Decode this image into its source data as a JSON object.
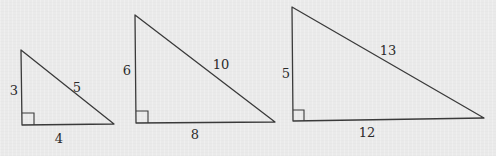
{
  "diagram": {
    "title": "",
    "stroke_color": "#3a3a3a",
    "background_color": "#eaeaea",
    "triangles": [
      {
        "id": "triangle-3-4-5",
        "vertices": {
          "top": [
            21,
            50
          ],
          "right_angle": [
            22,
            125
          ],
          "right": [
            114,
            124
          ]
        },
        "right_angle_box": 12,
        "labels": {
          "vertical": {
            "text": "3",
            "pos": [
              14,
              90
            ]
          },
          "hypotenuse": {
            "text": "5",
            "pos": [
              77,
              87
            ]
          },
          "base": {
            "text": "4",
            "pos": [
              59,
              138
            ]
          }
        }
      },
      {
        "id": "triangle-6-8-10",
        "vertices": {
          "top": [
            135,
            15
          ],
          "right_angle": [
            136,
            123
          ],
          "right": [
            275,
            122
          ]
        },
        "right_angle_box": 12,
        "labels": {
          "vertical": {
            "text": "6",
            "pos": [
              127,
              70
            ]
          },
          "hypotenuse": {
            "text": "10",
            "pos": [
              221,
              64
            ]
          },
          "base": {
            "text": "8",
            "pos": [
              195,
              134
            ]
          }
        }
      },
      {
        "id": "triangle-5-12-13",
        "vertices": {
          "top": [
            292,
            7
          ],
          "right_angle": [
            293,
            121
          ],
          "right": [
            484,
            118
          ]
        },
        "right_angle_box": 11,
        "labels": {
          "vertical": {
            "text": "5",
            "pos": [
              286,
              73
            ]
          },
          "hypotenuse": {
            "text": "13",
            "pos": [
              388,
              50
            ]
          },
          "base": {
            "text": "12",
            "pos": [
              367,
              132
            ]
          }
        }
      }
    ]
  }
}
